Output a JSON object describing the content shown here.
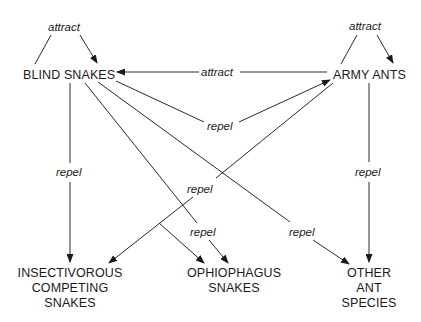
{
  "nodes": {
    "blind_snakes": "BLIND SNAKES",
    "army_ants": "ARMY ANTS",
    "insectivorous": [
      "INSECTIVOROUS",
      "COMPETING",
      "SNAKES"
    ],
    "ophiophagus": [
      "OPHIOPHAGUS",
      "SNAKES"
    ],
    "other_ants": [
      "OTHER",
      "ANT",
      "SPECIES"
    ]
  },
  "edges": [
    {
      "id": "blind-self",
      "from": "BLIND SNAKES",
      "to": "BLIND SNAKES",
      "label": "attract"
    },
    {
      "id": "army-self",
      "from": "ARMY ANTS",
      "to": "ARMY ANTS",
      "label": "attract"
    },
    {
      "id": "army-to-blind",
      "from": "ARMY ANTS",
      "to": "BLIND SNAKES",
      "label": "attract"
    },
    {
      "id": "blind-to-army",
      "from": "BLIND SNAKES",
      "to": "ARMY ANTS",
      "label": "repel"
    },
    {
      "id": "blind-to-insectivorous",
      "from": "BLIND SNAKES",
      "to": "INSECTIVOROUS COMPETING SNAKES",
      "label": "repel"
    },
    {
      "id": "army-to-insectivorous-ophiophagus",
      "from": "ARMY ANTS",
      "to": "INSECTIVOROUS COMPETING SNAKES / OPHIOPHAGUS SNAKES",
      "label": "repel"
    },
    {
      "id": "blind-to-ophiophagus",
      "from": "BLIND SNAKES",
      "to": "OPHIOPHAGUS SNAKES",
      "label": "repel"
    },
    {
      "id": "blind-to-other-ants",
      "from": "BLIND SNAKES",
      "to": "OTHER ANT SPECIES",
      "label": "repel"
    },
    {
      "id": "army-to-other-ants",
      "from": "ARMY ANTS",
      "to": "OTHER ANT SPECIES",
      "label": "repel"
    }
  ]
}
